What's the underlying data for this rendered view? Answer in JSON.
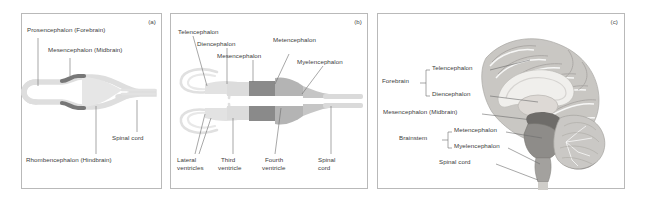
{
  "figure": {
    "panels": [
      {
        "id": "a",
        "tag": "(a)",
        "name": "three-vesicle-stage",
        "labels": [
          {
            "key": "prosencephalon",
            "text": "Prosencephalon (Forebrain)"
          },
          {
            "key": "mesencephalon",
            "text": "Mesencephalon (Midbrain)"
          },
          {
            "key": "rhombencephalon",
            "text": "Rhombencephalon (Hindbrain)"
          },
          {
            "key": "spinal_cord",
            "text": "Spinal cord"
          }
        ]
      },
      {
        "id": "b",
        "tag": "(b)",
        "name": "five-vesicle-stage",
        "labels": [
          {
            "key": "telencephalon",
            "text": "Telencephalon"
          },
          {
            "key": "diencephalon",
            "text": "Diencephalon"
          },
          {
            "key": "mesencephalon",
            "text": "Mesencephalon"
          },
          {
            "key": "metencephalon",
            "text": "Metencephalon"
          },
          {
            "key": "myelencephalon",
            "text": "Myelencephalon"
          },
          {
            "key": "lateral_ventricles",
            "text": "Lateral\nventricles"
          },
          {
            "key": "lateral_ventricles_l1",
            "text": "Lateral"
          },
          {
            "key": "lateral_ventricles_l2",
            "text": "ventricles"
          },
          {
            "key": "third_ventricle_l1",
            "text": "Third"
          },
          {
            "key": "third_ventricle_l2",
            "text": "ventricle"
          },
          {
            "key": "fourth_ventricle_l1",
            "text": "Fourth"
          },
          {
            "key": "fourth_ventricle_l2",
            "text": "ventricle"
          },
          {
            "key": "spinal_cord_l1",
            "text": "Spinal"
          },
          {
            "key": "spinal_cord_l2",
            "text": "cord"
          }
        ]
      },
      {
        "id": "c",
        "tag": "(c)",
        "name": "adult-brain-midsagittal",
        "labels": [
          {
            "key": "forebrain",
            "text": "Forebrain"
          },
          {
            "key": "telencephalon",
            "text": "Telencephalon"
          },
          {
            "key": "diencephalon",
            "text": "Diencephalon"
          },
          {
            "key": "mesencephalon",
            "text": "Mesencephalon (Midbrain)"
          },
          {
            "key": "brainstem",
            "text": "Brainstem"
          },
          {
            "key": "metencephalon",
            "text": "Metencephalon"
          },
          {
            "key": "myelencephalon",
            "text": "Myelencephalon"
          },
          {
            "key": "spinal_cord",
            "text": "Spinal cord"
          }
        ]
      }
    ]
  },
  "colors": {
    "border": "#b9b9b9",
    "text": "#3c3c3c",
    "leader": "#6d6d6d",
    "tube_light": "#dedede",
    "tube_mid": "#bcbcbc",
    "tube_dark": "#8c8c8c",
    "tube_darkest": "#6f6f6f",
    "brain_cortex": "#c9c7c4",
    "brain_white": "#ededea",
    "brain_stem": "#8e8c89",
    "brain_shadow": "#9a9895"
  }
}
